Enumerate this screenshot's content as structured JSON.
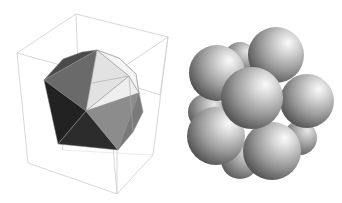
{
  "figure": {
    "panels": [
      {
        "id": "icosahedron",
        "description": "Shaded icosahedron inside a wireframe bounding box",
        "colors": {
          "box_edge": "#d4d4d4",
          "face_dark": "#2a2a2a",
          "face_darker": "#1c1c1c",
          "face_mid": "#6e6e6e",
          "face_midlight": "#8c8c8c",
          "face_light": "#e6e6e6",
          "face_lighter": "#f0f0f0",
          "face_top": "#4a4a4a",
          "edge": "#9a9a9a"
        }
      },
      {
        "id": "sphere-cluster",
        "description": "Icosahedral cluster of 13 shaded spheres",
        "colors": {
          "highlight": "#f4f4f4",
          "mid": "#9a9a9a",
          "shadow": "#3a3a3a"
        }
      }
    ]
  }
}
